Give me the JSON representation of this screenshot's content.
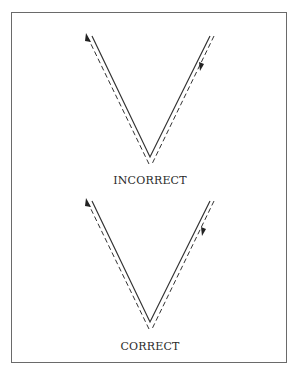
{
  "figure": {
    "border_color": "#6a6a6a",
    "line_color": "#333333",
    "panels": [
      {
        "id": "incorrect",
        "label": "INCORRECT",
        "solid_path": [
          [
            92,
            36
          ],
          [
            150,
            157
          ],
          [
            210,
            36
          ]
        ],
        "dashed_left": [
          [
            88,
            38
          ],
          [
            149,
            164
          ]
        ],
        "dashed_right": [
          [
            152,
            164
          ],
          [
            214,
            36
          ]
        ],
        "arrows": [
          {
            "position": "top-left",
            "direction": "up-left",
            "at": [
              87,
              34
            ]
          },
          {
            "position": "right-upper",
            "direction": "down-left",
            "at": [
              201,
              68
            ]
          }
        ]
      },
      {
        "id": "correct",
        "label": "CORRECT",
        "solid_path": [
          [
            92,
            201
          ],
          [
            150,
            322
          ],
          [
            210,
            201
          ]
        ],
        "dashed_left": [
          [
            88,
            203
          ],
          [
            149,
            329
          ]
        ],
        "dashed_right": [
          [
            152,
            329
          ],
          [
            214,
            201
          ]
        ],
        "arrows": [
          {
            "position": "top-left",
            "direction": "up-left",
            "at": [
              87,
              199
            ]
          },
          {
            "position": "right-upper",
            "direction": "down-left",
            "at": [
              203,
              233
            ]
          }
        ]
      }
    ]
  }
}
